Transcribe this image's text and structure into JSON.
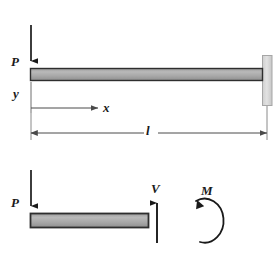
{
  "figure": {
    "kind": "cantilever-beam-free-body-diagram",
    "background_color": "#ffffff",
    "line_color": "#1a1a1a",
    "thin_line_color": "#595959",
    "beam_fill_light": "#b5b5b5",
    "beam_fill_dark": "#8e8e8e",
    "beam_border_color": "#2b2b2b",
    "wall_fill": "#d6d6d6",
    "wall_border_color": "#9a9a9a"
  },
  "upper_diagram": {
    "load_label": "P",
    "y_axis_label": "y",
    "x_dimension_label": "x",
    "length_dimension_label": "l"
  },
  "lower_diagram": {
    "load_label": "P",
    "shear_label": "V",
    "moment_label": "M"
  }
}
